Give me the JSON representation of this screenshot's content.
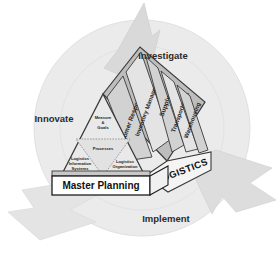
{
  "diagram": {
    "cycle": {
      "labels": [
        {
          "id": "innovate",
          "text": "Innovate"
        },
        {
          "id": "investigate",
          "text": "Investigate"
        },
        {
          "id": "implement",
          "text": "Implement"
        }
      ],
      "arrows": [
        {
          "id": "arrow-top",
          "direction": "up"
        },
        {
          "id": "arrow-right",
          "direction": "down-right"
        },
        {
          "id": "arrow-left",
          "direction": "left"
        }
      ]
    },
    "roof_panels": [
      {
        "id": "customer-response",
        "text": "Customer Response"
      },
      {
        "id": "inventory-management",
        "text": "Inventory Management"
      },
      {
        "id": "supply",
        "text": "Supply"
      },
      {
        "id": "transportation",
        "text": "Transportation"
      },
      {
        "id": "warehousing",
        "text": "Warehousing"
      }
    ],
    "gable": {
      "upper": {
        "id": "measure-goals",
        "line1": "Measure",
        "line2": "&",
        "line3": "Goals"
      },
      "middle": {
        "id": "processes",
        "text": "Processes"
      },
      "left": {
        "id": "logistics-information-systems",
        "line1": "Logistics",
        "line2": "Information",
        "line3": "Systems"
      },
      "right": {
        "id": "logistics-organization",
        "line1": "Logistics",
        "line2": "Organization"
      }
    },
    "side_band": {
      "id": "logistics",
      "text": "LOGISTICS"
    },
    "foundation": {
      "id": "master-planning",
      "text": "Master Planning"
    },
    "colors": {
      "circle_fill": "#ebebeb",
      "arrow_fill": "#d9d9d9",
      "panel_fill": "#d2d2d2",
      "panel_fill_alt": "#e4e4e4",
      "gable_fill": "#e9e9e9",
      "side_fill": "#f2f2f2",
      "foundation_fill": "#ffffff",
      "outline": "#3a3a3a",
      "text": "#1d1d1d"
    }
  }
}
